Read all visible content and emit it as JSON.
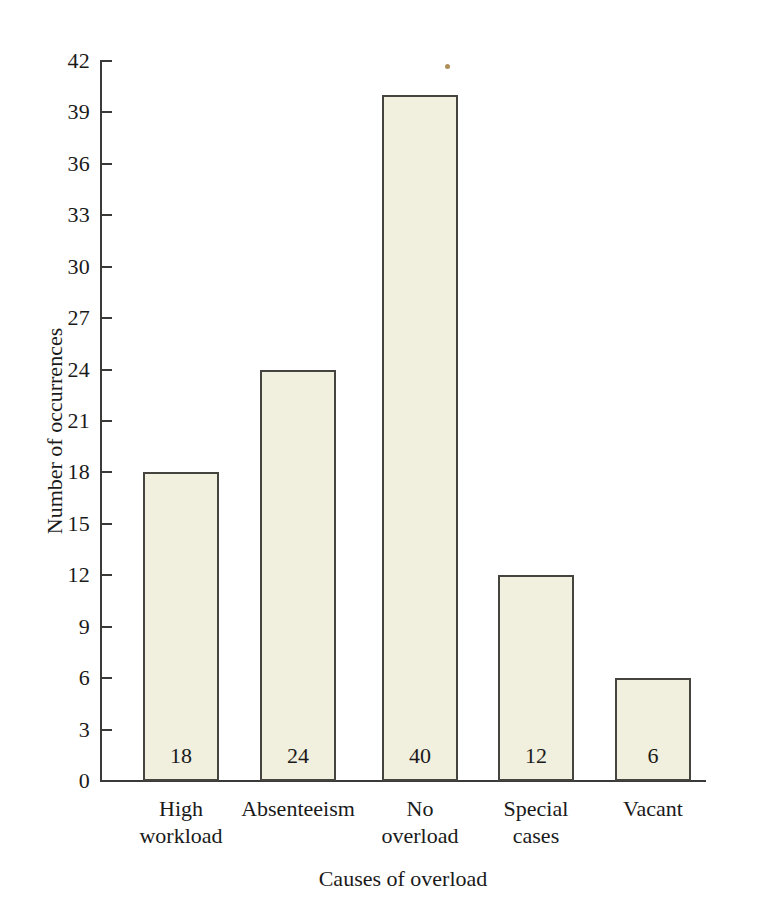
{
  "chart_data": {
    "type": "bar",
    "title": "",
    "xlabel": "Causes of overload",
    "ylabel": "Number of occurrences",
    "categories": [
      "High workload",
      "Absenteeism",
      "No overload",
      "Special cases",
      "Vacant"
    ],
    "category_lines": [
      [
        "High",
        "workload"
      ],
      [
        "Absenteeism",
        ""
      ],
      [
        "No",
        "overload"
      ],
      [
        "Special",
        "cases"
      ],
      [
        "Vacant",
        ""
      ]
    ],
    "values": [
      18,
      24,
      40,
      12,
      6
    ],
    "value_labels": [
      "18",
      "24",
      "40",
      "12",
      "6"
    ],
    "ylim": [
      0,
      42
    ],
    "ytick_step": 3,
    "ytick_labels": [
      "42",
      "39",
      "36",
      "33",
      "30",
      "27",
      "24",
      "21",
      "18",
      "15",
      "12",
      "9",
      "6",
      "3",
      "0"
    ],
    "ytick_values": [
      42,
      39,
      36,
      33,
      30,
      27,
      24,
      21,
      18,
      15,
      12,
      9,
      6,
      3,
      0
    ],
    "grid": false,
    "legend": false,
    "legend_position": "none",
    "colors": {
      "bar_fill": "#f1efdd",
      "bar_stroke": "#45443f",
      "axis": "#3a3a38",
      "text": "#1a1a1a",
      "background": "#ffffff"
    }
  }
}
